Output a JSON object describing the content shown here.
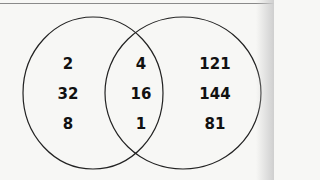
{
  "venn": {
    "left_only": [
      "2",
      "32",
      "8"
    ],
    "both": [
      "4",
      "16",
      "1"
    ],
    "right_only": [
      "121",
      "144",
      "81"
    ]
  },
  "colors": {
    "stroke": "#222222",
    "background": "#f7f7f5"
  }
}
